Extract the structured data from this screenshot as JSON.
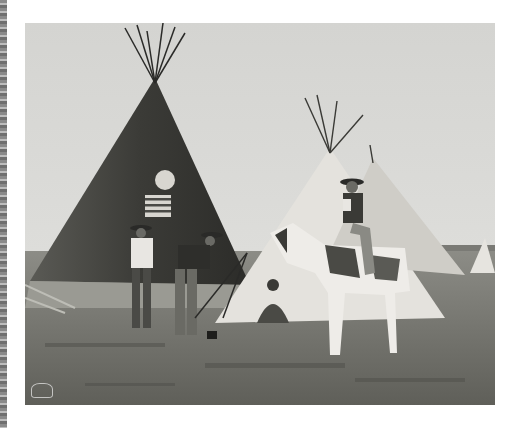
{
  "image": {
    "description": "Black-and-white historical photograph of tipis on an open plain, with men standing by a large tipi, a seated figure, and a rider on a pinto horse",
    "subjects": [
      "large painted tipi with flag",
      "tipi",
      "standing man in hat",
      "man in vest and hat",
      "seated person",
      "rider on pinto horse"
    ],
    "colors": {
      "background": "#ffffff",
      "sky": "#d9d9d6",
      "ground": "#6e6e68",
      "tipi_dark": "#3a3a36",
      "tipi_light": "#e6e4df"
    }
  }
}
